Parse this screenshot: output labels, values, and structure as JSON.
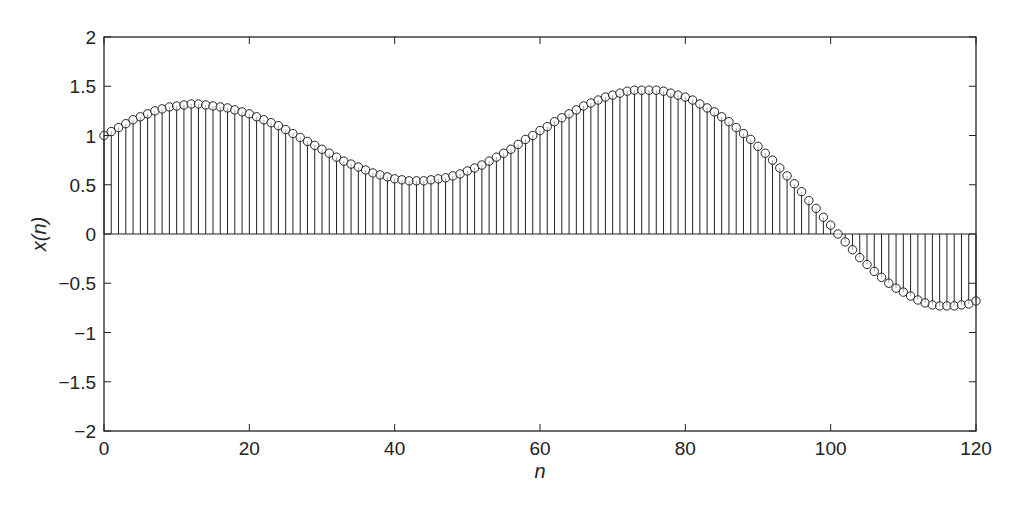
{
  "chart_data": {
    "type": "stem",
    "title": "",
    "xlabel": "n",
    "ylabel": "x(n)",
    "xlim": [
      0,
      120
    ],
    "ylim": [
      -2,
      2
    ],
    "xticks": [
      0,
      20,
      40,
      60,
      80,
      100,
      120
    ],
    "xtick_labels": [
      "0",
      "20",
      "40",
      "60",
      "80",
      "100",
      "120"
    ],
    "yticks": [
      -2,
      -1.5,
      -1,
      -0.5,
      0,
      0.5,
      1,
      1.5,
      2
    ],
    "ytick_labels": [
      "−2",
      "−1.5",
      "−1",
      "−0.5",
      "0",
      "0.5",
      "1",
      "1.5",
      "2"
    ],
    "grid": false,
    "legend": null,
    "marker": "open-circle",
    "color": "#222222",
    "x": [
      0,
      1,
      2,
      3,
      4,
      5,
      6,
      7,
      8,
      9,
      10,
      11,
      12,
      13,
      14,
      15,
      16,
      17,
      18,
      19,
      20,
      21,
      22,
      23,
      24,
      25,
      26,
      27,
      28,
      29,
      30,
      31,
      32,
      33,
      34,
      35,
      36,
      37,
      38,
      39,
      40,
      41,
      42,
      43,
      44,
      45,
      46,
      47,
      48,
      49,
      50,
      51,
      52,
      53,
      54,
      55,
      56,
      57,
      58,
      59,
      60,
      61,
      62,
      63,
      64,
      65,
      66,
      67,
      68,
      69,
      70,
      71,
      72,
      73,
      74,
      75,
      76,
      77,
      78,
      79,
      80,
      81,
      82,
      83,
      84,
      85,
      86,
      87,
      88,
      89,
      90,
      91,
      92,
      93,
      94,
      95,
      96,
      97,
      98,
      99,
      100,
      101,
      102,
      103,
      104,
      105,
      106,
      107,
      108,
      109,
      110,
      111,
      112,
      113,
      114,
      115,
      116,
      117,
      118,
      119,
      120
    ],
    "values": [
      1.0,
      1.04,
      1.08,
      1.12,
      1.16,
      1.19,
      1.22,
      1.25,
      1.27,
      1.29,
      1.3,
      1.31,
      1.32,
      1.32,
      1.31,
      1.3,
      1.29,
      1.28,
      1.26,
      1.24,
      1.22,
      1.19,
      1.16,
      1.13,
      1.1,
      1.06,
      1.02,
      0.98,
      0.94,
      0.9,
      0.86,
      0.82,
      0.78,
      0.74,
      0.71,
      0.68,
      0.65,
      0.62,
      0.6,
      0.58,
      0.56,
      0.55,
      0.54,
      0.54,
      0.54,
      0.55,
      0.56,
      0.57,
      0.59,
      0.61,
      0.64,
      0.67,
      0.7,
      0.74,
      0.78,
      0.82,
      0.86,
      0.91,
      0.96,
      1.0,
      1.05,
      1.09,
      1.14,
      1.18,
      1.22,
      1.26,
      1.3,
      1.33,
      1.36,
      1.39,
      1.41,
      1.43,
      1.45,
      1.46,
      1.46,
      1.46,
      1.46,
      1.45,
      1.43,
      1.41,
      1.39,
      1.36,
      1.32,
      1.28,
      1.24,
      1.19,
      1.14,
      1.08,
      1.02,
      0.96,
      0.89,
      0.82,
      0.75,
      0.67,
      0.59,
      0.51,
      0.43,
      0.34,
      0.26,
      0.17,
      0.09,
      0.0,
      -0.08,
      -0.16,
      -0.24,
      -0.31,
      -0.38,
      -0.44,
      -0.5,
      -0.55,
      -0.59,
      -0.63,
      -0.67,
      -0.7,
      -0.72,
      -0.73,
      -0.73,
      -0.73,
      -0.72,
      -0.71,
      -0.68
    ]
  },
  "layout": {
    "plot_left": 104,
    "plot_right": 976,
    "plot_top": 37,
    "plot_bottom": 431
  }
}
